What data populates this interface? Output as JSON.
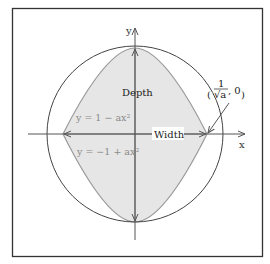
{
  "figure": {
    "frame": {
      "stroke": "#333333"
    },
    "axes": {
      "x_label": "x",
      "y_label": "y"
    },
    "labels": {
      "depth": "Depth",
      "width": "Width",
      "upper_curve": "y = 1 − ax²",
      "lower_curve": "y = −1 + ax²",
      "point_numerator": "1",
      "point_denominator": "√a",
      "point_rest": ", 0",
      "point_open": "(",
      "point_close": ")"
    },
    "colors": {
      "shade": "#e6e6e6",
      "curve": "#9a9a9a",
      "circle": "#444444",
      "axis": "#555555",
      "equation_text": "#8a8a8a"
    },
    "geometry": {
      "circle": {
        "cx": 135,
        "cy": 134,
        "r": 90
      },
      "intersections": [
        [
          63,
          134
        ],
        [
          207,
          134
        ]
      ],
      "top": [
        135,
        48
      ],
      "bottom": [
        135,
        222
      ]
    }
  }
}
